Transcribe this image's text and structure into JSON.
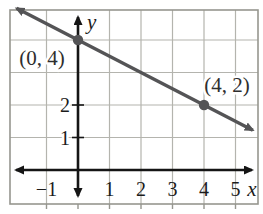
{
  "figure": {
    "background": "#ffffff"
  },
  "colors": {
    "grid": "#b4b4ae",
    "frame": "#96968f",
    "axis": "#151515",
    "line": "#545456",
    "point": "#545456",
    "tick_text": "#1b1b1b",
    "point_label_text": "#2e2e2e"
  },
  "chart_data": {
    "type": "line",
    "title": "",
    "xlabel": "x",
    "ylabel": "y",
    "xlim": [
      -2.16,
      5.71
    ],
    "ylim": [
      -1.05,
      4.92
    ],
    "grid": true,
    "grid_x": [
      -1,
      1,
      2,
      3,
      4,
      5
    ],
    "grid_y": [
      1,
      2,
      3,
      4
    ],
    "x_ticks": [
      -1,
      1,
      2,
      3,
      4,
      5
    ],
    "x_tick_labels": [
      "−1",
      "1",
      "2",
      "3",
      "4",
      "5"
    ],
    "y_ticks": [
      1,
      2
    ],
    "y_tick_labels": [
      "1",
      "2"
    ],
    "line": {
      "slope": -0.5,
      "intercept": 4,
      "x_start": -1.95,
      "x_end": 5.55,
      "arrows": "both"
    },
    "points": [
      {
        "x": 0,
        "y": 4,
        "label": "(0, 4)"
      },
      {
        "x": 4,
        "y": 2,
        "label": "(4, 2)"
      }
    ]
  }
}
